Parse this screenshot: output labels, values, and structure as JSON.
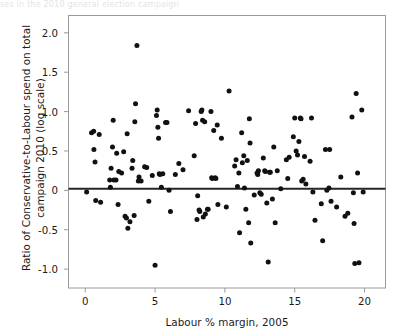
{
  "figure": {
    "caption_remnant": "ses in the 2010 general election campaign",
    "background_color": "#ffffff",
    "frame_color": "#9a9a9a",
    "point_color": "#111111",
    "line_color": "#262626"
  },
  "axes": {
    "x": {
      "title": "Labour % margin, 2005",
      "ticks": [
        "0",
        "5",
        "10",
        "15",
        "20"
      ],
      "tick_values": [
        0,
        5,
        10,
        15,
        20
      ],
      "min": -1.2,
      "max": 21.5
    },
    "y": {
      "title_line1": "Ratio of Conservative-to-Labour spend on total",
      "title_line2": "campaign 2010 (log scale)",
      "ticks": [
        "2.0",
        "1.5",
        "1.0",
        "0.5",
        "0",
        "-0.5",
        "-1.0"
      ],
      "tick_values": [
        2.0,
        1.5,
        1.0,
        0.5,
        0,
        -0.5,
        -1.0
      ],
      "min": -1.24,
      "max": 2.22
    }
  },
  "chart_data": {
    "type": "scatter",
    "title": "",
    "xlabel": "Labour % margin, 2005",
    "ylabel": "Ratio of Conservative-to-Labour spend on total campaign 2010 (log scale)",
    "xlim": [
      -1.2,
      21.5
    ],
    "ylim": [
      -1.24,
      2.22
    ],
    "grid": false,
    "legend": "none",
    "marker": "filled-circle",
    "marker_color": "#111111",
    "marker_size_px": 4.0,
    "annotations": [
      {
        "type": "hline",
        "y": 0.02,
        "label": "reference line at zero",
        "color": "#262626",
        "width_px": 2
      }
    ],
    "series": [
      {
        "name": "Constituencies",
        "points": [
          [
            0.1,
            -0.02
          ],
          [
            0.45,
            0.73
          ],
          [
            0.6,
            0.75
          ],
          [
            0.62,
            0.52
          ],
          [
            0.7,
            0.36
          ],
          [
            0.75,
            -0.13
          ],
          [
            1.0,
            0.71
          ],
          [
            1.1,
            -0.15
          ],
          [
            1.75,
            0.13
          ],
          [
            1.8,
            0.04
          ],
          [
            1.85,
            0.28
          ],
          [
            1.95,
            0.55
          ],
          [
            2.0,
            0.89
          ],
          [
            2.05,
            0.13
          ],
          [
            2.2,
            0.13
          ],
          [
            2.25,
            0.47
          ],
          [
            2.35,
            -0.18
          ],
          [
            2.4,
            0.24
          ],
          [
            2.6,
            0.22
          ],
          [
            2.75,
            0.49
          ],
          [
            2.85,
            -0.33
          ],
          [
            2.95,
            -0.35
          ],
          [
            3.0,
            0.72
          ],
          [
            3.05,
            -0.48
          ],
          [
            3.2,
            -0.4
          ],
          [
            3.35,
            0.28
          ],
          [
            3.4,
            0.38
          ],
          [
            3.5,
            -0.32
          ],
          [
            3.55,
            0.87
          ],
          [
            3.6,
            1.1
          ],
          [
            3.7,
            1.84
          ],
          [
            3.8,
            0.12
          ],
          [
            3.85,
            0.17
          ],
          [
            4.0,
            0.12
          ],
          [
            4.25,
            0.3
          ],
          [
            4.4,
            0.29
          ],
          [
            4.55,
            -0.14
          ],
          [
            4.8,
            0.19
          ],
          [
            5.0,
            -0.95
          ],
          [
            5.1,
            0.95
          ],
          [
            5.15,
            1.02
          ],
          [
            5.2,
            0.8
          ],
          [
            5.25,
            0.66
          ],
          [
            5.3,
            0.21
          ],
          [
            5.35,
            0.2
          ],
          [
            5.45,
            0.04
          ],
          [
            5.55,
            0.21
          ],
          [
            5.75,
            0.86
          ],
          [
            5.85,
            0.86
          ],
          [
            6.0,
            0.0
          ],
          [
            6.1,
            -0.27
          ],
          [
            6.45,
            0.2
          ],
          [
            6.7,
            0.34
          ],
          [
            7.0,
            0.26
          ],
          [
            7.4,
            1.01
          ],
          [
            7.8,
            0.44
          ],
          [
            7.9,
            0.85
          ],
          [
            8.0,
            -0.37
          ],
          [
            8.05,
            -0.07
          ],
          [
            8.15,
            -0.25
          ],
          [
            8.2,
            -0.27
          ],
          [
            8.3,
            1.0
          ],
          [
            8.35,
            1.02
          ],
          [
            8.4,
            0.89
          ],
          [
            8.45,
            -0.34
          ],
          [
            8.55,
            0.87
          ],
          [
            8.6,
            -0.3
          ],
          [
            8.75,
            -0.24
          ],
          [
            8.8,
            -0.24
          ],
          [
            9.0,
            1.0
          ],
          [
            9.05,
            0.16
          ],
          [
            9.1,
            0.15
          ],
          [
            9.2,
            0.76
          ],
          [
            9.3,
            0.16
          ],
          [
            9.35,
            0.15
          ],
          [
            9.45,
            0.83
          ],
          [
            9.5,
            -0.18
          ],
          [
            9.75,
            0.66
          ],
          [
            10.1,
            -0.21
          ],
          [
            10.3,
            1.26
          ],
          [
            10.7,
            0.31
          ],
          [
            10.8,
            0.39
          ],
          [
            10.9,
            0.05
          ],
          [
            11.0,
            0.22
          ],
          [
            11.05,
            -0.54
          ],
          [
            11.2,
            0.73
          ],
          [
            11.25,
            0.35
          ],
          [
            11.35,
            0.44
          ],
          [
            11.4,
            0.03
          ],
          [
            11.5,
            -0.24
          ],
          [
            11.6,
            0.38
          ],
          [
            11.7,
            -0.41
          ],
          [
            11.75,
            0.91
          ],
          [
            11.8,
            0.6
          ],
          [
            11.85,
            -0.67
          ],
          [
            12.1,
            -0.06
          ],
          [
            12.3,
            0.22
          ],
          [
            12.35,
            0.2
          ],
          [
            12.4,
            0.25
          ],
          [
            12.5,
            -0.03
          ],
          [
            12.6,
            -0.05
          ],
          [
            12.75,
            0.41
          ],
          [
            12.85,
            0.25
          ],
          [
            12.9,
            0.24
          ],
          [
            13.0,
            -0.16
          ],
          [
            13.1,
            -0.91
          ],
          [
            13.2,
            0.23
          ],
          [
            13.25,
            0.23
          ],
          [
            13.4,
            -0.11
          ],
          [
            13.5,
            0.55
          ],
          [
            13.6,
            -0.41
          ],
          [
            13.75,
            0.25
          ],
          [
            14.0,
            0.02
          ],
          [
            14.4,
            0.39
          ],
          [
            14.5,
            0.15
          ],
          [
            14.6,
            0.42
          ],
          [
            14.9,
            0.68
          ],
          [
            15.0,
            0.92
          ],
          [
            15.1,
            0.5
          ],
          [
            15.2,
            0.45
          ],
          [
            15.3,
            0.62
          ],
          [
            15.4,
            0.92
          ],
          [
            15.45,
            0.91
          ],
          [
            15.5,
            0.12
          ],
          [
            15.6,
            0.14
          ],
          [
            15.7,
            0.43
          ],
          [
            15.8,
            0.08
          ],
          [
            16.1,
            0.37
          ],
          [
            16.2,
            0.92
          ],
          [
            16.3,
            -0.02
          ],
          [
            16.45,
            -0.38
          ],
          [
            16.9,
            -0.17
          ],
          [
            17.0,
            -0.64
          ],
          [
            17.2,
            0.52
          ],
          [
            17.3,
            0.0
          ],
          [
            17.45,
            0.03
          ],
          [
            17.5,
            0.52
          ],
          [
            17.6,
            -0.14
          ],
          [
            18.0,
            -0.21
          ],
          [
            18.3,
            0.17
          ],
          [
            18.6,
            -0.33
          ],
          [
            18.8,
            -0.29
          ],
          [
            19.1,
            0.93
          ],
          [
            19.2,
            -0.03
          ],
          [
            19.25,
            -0.42
          ],
          [
            19.3,
            -0.93
          ],
          [
            19.4,
            1.23
          ],
          [
            19.5,
            0.22
          ],
          [
            19.6,
            -0.92
          ],
          [
            19.8,
            1.02
          ],
          [
            19.9,
            -0.02
          ]
        ]
      }
    ]
  }
}
